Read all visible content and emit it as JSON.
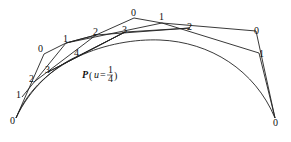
{
  "diagram": {
    "type": "de-casteljau-construction",
    "curve_label": {
      "symbol": "P",
      "param": "u",
      "equals": "=",
      "numerator": "1",
      "denominator": "4"
    },
    "labels": {
      "left_end": "0",
      "left_1": "1",
      "left_2": "2",
      "left_3": "3",
      "left_4": "4",
      "outer_0a": "0",
      "outer_1a": "1",
      "mid_2a": "2",
      "mid_3a": "3",
      "top_0": "0",
      "top_1": "1",
      "top_2": "2",
      "right_0": "0",
      "right_1": "1",
      "right_end": "0"
    },
    "colors": {
      "stroke": "#222222",
      "background": "#ffffff"
    }
  }
}
